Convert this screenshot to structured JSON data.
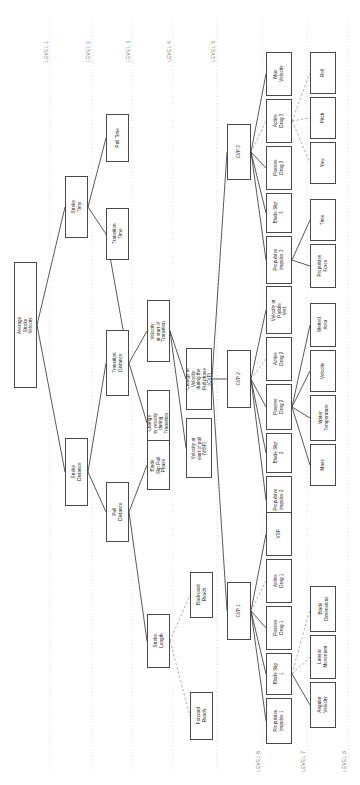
{
  "diagram": {
    "orientation": "rotated-90",
    "levels": [
      {
        "id": "l1",
        "label": "LEVEL 1",
        "x": 50
      },
      {
        "id": "l2",
        "label": "LEVEL 2",
        "x": 92
      },
      {
        "id": "l3",
        "label": "LEVEL 3",
        "x": 132
      },
      {
        "id": "l4",
        "label": "LEVEL 4",
        "x": 173
      },
      {
        "id": "l5",
        "label": "LEVEL 5",
        "x": 217
      },
      {
        "id": "l6",
        "label": "LEVEL 6",
        "x": 262
      },
      {
        "id": "l7",
        "label": "LEVEL 7",
        "x": 307
      },
      {
        "id": "l8",
        "label": "LEVEL 8",
        "x": 348
      }
    ],
    "colors": {
      "node_border": "#4a4a4a",
      "node_fill": "#ffffff",
      "edge_solid": "#3c3c3c",
      "edge_dashed": "#8c8c8c",
      "level_line": "#cfcfcf",
      "level_text": "#7a7a7a",
      "background": "#ffffff"
    },
    "nodes": [
      {
        "id": "avg_stroke_velocity",
        "label": "Average Stroke Velocity",
        "level": 1,
        "x": 14,
        "y": 262,
        "w": 23,
        "h": 126
      },
      {
        "id": "stroke_time",
        "label": "Stroke Time",
        "level": 2,
        "x": 65,
        "y": 176,
        "w": 23,
        "h": 62
      },
      {
        "id": "stroke_distance",
        "label": "Stroke Distance",
        "level": 2,
        "x": 65,
        "y": 438,
        "w": 23,
        "h": 68
      },
      {
        "id": "pull_time",
        "label": "Pull Time",
        "level": 3,
        "x": 106,
        "y": 114,
        "w": 23,
        "h": 48
      },
      {
        "id": "transition_time",
        "label": "Transition Time",
        "level": 3,
        "x": 106,
        "y": 208,
        "w": 23,
        "h": 52
      },
      {
        "id": "transition_distance",
        "label": "Transition Distance",
        "level": 3,
        "x": 106,
        "y": 330,
        "w": 23,
        "h": 66
      },
      {
        "id": "pull_distance",
        "label": "Pull Distance",
        "level": 3,
        "x": 106,
        "y": 482,
        "w": 23,
        "h": 60
      },
      {
        "id": "velocity_start_transition",
        "label": "Velocity at start of Transition",
        "level": 4,
        "x": 147,
        "y": 300,
        "w": 23,
        "h": 62
      },
      {
        "id": "change_velocity_transition",
        "label": "Change in velocity during Transition",
        "level": 4,
        "x": 147,
        "y": 390,
        "w": 23,
        "h": 66
      },
      {
        "id": "blade_slip_pull_phase",
        "label": "Blade Slip Pull Phase",
        "level": 4,
        "x": 147,
        "y": 440,
        "w": 23,
        "h": 50
      },
      {
        "id": "stroke_length",
        "label": "Stroke Length",
        "level": 4,
        "x": 147,
        "y": 614,
        "w": 23,
        "h": 54
      },
      {
        "id": "backward_reach",
        "label": "Backward Reach",
        "level": 5,
        "x": 190,
        "y": 572,
        "w": 23,
        "h": 46
      },
      {
        "id": "forward_reach",
        "label": "Forward Reach",
        "level": 5,
        "x": 190,
        "y": 692,
        "w": 23,
        "h": 48
      },
      {
        "id": "cvp",
        "label": "Change in Velocity during the Pull phase (CVP)",
        "level": 5,
        "x": 186,
        "y": 348,
        "w": 26,
        "h": 62
      },
      {
        "id": "vtsp",
        "label": "Velocity at start of pull (VtSP)",
        "level": 5,
        "x": 186,
        "y": 418,
        "w": 26,
        "h": 60
      },
      {
        "id": "cvp3",
        "label": "CVP 3",
        "level": 6,
        "x": 227,
        "y": 124,
        "w": 24,
        "h": 56
      },
      {
        "id": "cvp2",
        "label": "CVP 2",
        "level": 6,
        "x": 227,
        "y": 350,
        "w": 24,
        "h": 58
      },
      {
        "id": "cvp1",
        "label": "CVP 1",
        "level": 6,
        "x": 227,
        "y": 582,
        "w": 24,
        "h": 58
      },
      {
        "id": "max_velocity",
        "label": "Max. Velocity",
        "level": 7,
        "x": 266,
        "y": 52,
        "w": 26,
        "h": 44
      },
      {
        "id": "active_drag_3",
        "label": "Active Drag 3",
        "level": 7,
        "x": 266,
        "y": 99,
        "w": 26,
        "h": 44
      },
      {
        "id": "passive_drag_3",
        "label": "Passive Drag 3",
        "level": 7,
        "x": 266,
        "y": 146,
        "w": 26,
        "h": 44
      },
      {
        "id": "blade_slip_3",
        "label": "Blade Slip 3",
        "level": 7,
        "x": 266,
        "y": 193,
        "w": 26,
        "h": 40
      },
      {
        "id": "propulsive_impulse_3",
        "label": "Propulsive Impulse 3",
        "level": 7,
        "x": 266,
        "y": 236,
        "w": 26,
        "h": 48
      },
      {
        "id": "velocity_paddle_vert",
        "label": "Velocity at Paddle Vert.",
        "level": 7,
        "x": 266,
        "y": 286,
        "w": 26,
        "h": 48
      },
      {
        "id": "active_drag_2",
        "label": "Active Drag 2",
        "level": 7,
        "x": 266,
        "y": 337,
        "w": 26,
        "h": 44
      },
      {
        "id": "passive_drag_2",
        "label": "Passive Drag 2",
        "level": 7,
        "x": 266,
        "y": 384,
        "w": 26,
        "h": 46
      },
      {
        "id": "blade_slip_2",
        "label": "Blade Slip 2",
        "level": 7,
        "x": 266,
        "y": 433,
        "w": 26,
        "h": 40
      },
      {
        "id": "propulsive_impulse_2",
        "label": "Propulsive Impulse 2",
        "level": 7,
        "x": 266,
        "y": 476,
        "w": 26,
        "h": 48
      },
      {
        "id": "vsp",
        "label": "VSP",
        "level": 7,
        "x": 266,
        "y": 512,
        "w": 26,
        "h": 44
      },
      {
        "id": "active_drag_1",
        "label": "Active Drag 1",
        "level": 7,
        "x": 266,
        "y": 559,
        "w": 26,
        "h": 44
      },
      {
        "id": "passive_drag_1",
        "label": "Passive Drag 1",
        "level": 7,
        "x": 266,
        "y": 606,
        "w": 26,
        "h": 44
      },
      {
        "id": "blade_slip_1",
        "label": "Blade Slip 1",
        "level": 7,
        "x": 266,
        "y": 653,
        "w": 26,
        "h": 42
      },
      {
        "id": "propulsive_impulse_1",
        "label": "Propulsive Impulse 1",
        "level": 7,
        "x": 266,
        "y": 698,
        "w": 26,
        "h": 46
      },
      {
        "id": "roll",
        "label": "Roll",
        "level": 8,
        "x": 310,
        "y": 52,
        "w": 26,
        "h": 42
      },
      {
        "id": "pitch",
        "label": "Pitch",
        "level": 8,
        "x": 310,
        "y": 97,
        "w": 26,
        "h": 42
      },
      {
        "id": "yaw",
        "label": "Yaw",
        "level": 8,
        "x": 310,
        "y": 142,
        "w": 26,
        "h": 42
      },
      {
        "id": "time",
        "label": "Time",
        "level": 8,
        "x": 310,
        "y": 199,
        "w": 26,
        "h": 42
      },
      {
        "id": "propulsive_force",
        "label": "Propulsive Force",
        "level": 8,
        "x": 310,
        "y": 244,
        "w": 26,
        "h": 44
      },
      {
        "id": "wetted_area",
        "label": "Wetted Area",
        "level": 8,
        "x": 310,
        "y": 303,
        "w": 26,
        "h": 44
      },
      {
        "id": "velocity",
        "label": "Velocity",
        "level": 8,
        "x": 310,
        "y": 350,
        "w": 26,
        "h": 42
      },
      {
        "id": "water_temperature",
        "label": "Water Temperature",
        "level": 8,
        "x": 310,
        "y": 395,
        "w": 26,
        "h": 46
      },
      {
        "id": "mass",
        "label": "Mass",
        "level": 8,
        "x": 310,
        "y": 444,
        "w": 26,
        "h": 42
      },
      {
        "id": "blade_dimensions",
        "label": "Blade Dimensions",
        "level": 8,
        "x": 310,
        "y": 586,
        "w": 26,
        "h": 46
      },
      {
        "id": "lateral_movement",
        "label": "Lateral Movement",
        "level": 8,
        "x": 310,
        "y": 635,
        "w": 26,
        "h": 44
      },
      {
        "id": "angular_velocity",
        "label": "Angular Velocity",
        "level": 8,
        "x": 310,
        "y": 682,
        "w": 26,
        "h": 46
      }
    ],
    "edges": [
      {
        "from": "avg_stroke_velocity",
        "to": "stroke_time",
        "style": "solid"
      },
      {
        "from": "avg_stroke_velocity",
        "to": "stroke_distance",
        "style": "solid"
      },
      {
        "from": "stroke_time",
        "to": "pull_time",
        "style": "solid"
      },
      {
        "from": "stroke_time",
        "to": "transition_time",
        "style": "solid"
      },
      {
        "from": "stroke_distance",
        "to": "transition_distance",
        "style": "solid"
      },
      {
        "from": "stroke_distance",
        "to": "pull_distance",
        "style": "solid"
      },
      {
        "from": "transition_distance",
        "to": "transition_time",
        "style": "solid"
      },
      {
        "from": "transition_distance",
        "to": "velocity_start_transition",
        "style": "solid"
      },
      {
        "from": "transition_distance",
        "to": "change_velocity_transition",
        "style": "solid"
      },
      {
        "from": "pull_distance",
        "to": "blade_slip_pull_phase",
        "style": "solid"
      },
      {
        "from": "pull_distance",
        "to": "stroke_length",
        "style": "solid"
      },
      {
        "from": "stroke_length",
        "to": "backward_reach",
        "style": "dashed"
      },
      {
        "from": "stroke_length",
        "to": "forward_reach",
        "style": "dashed"
      },
      {
        "from": "velocity_start_transition",
        "to": "cvp",
        "style": "solid"
      },
      {
        "from": "velocity_start_transition",
        "to": "vtsp",
        "style": "solid"
      },
      {
        "from": "cvp",
        "to": "cvp2",
        "style": "solid"
      },
      {
        "from": "cvp",
        "to": "cvp3",
        "style": "solid"
      },
      {
        "from": "cvp",
        "to": "cvp1",
        "style": "solid"
      },
      {
        "from": "cvp3",
        "to": "max_velocity",
        "style": "solid"
      },
      {
        "from": "cvp3",
        "to": "active_drag_3",
        "style": "dashed"
      },
      {
        "from": "cvp3",
        "to": "passive_drag_3",
        "style": "solid"
      },
      {
        "from": "cvp3",
        "to": "blade_slip_3",
        "style": "solid"
      },
      {
        "from": "cvp3",
        "to": "propulsive_impulse_3",
        "style": "solid"
      },
      {
        "from": "active_drag_3",
        "to": "roll",
        "style": "dashed"
      },
      {
        "from": "active_drag_3",
        "to": "pitch",
        "style": "dashed"
      },
      {
        "from": "active_drag_3",
        "to": "yaw",
        "style": "dashed"
      },
      {
        "from": "propulsive_impulse_3",
        "to": "time",
        "style": "solid"
      },
      {
        "from": "propulsive_impulse_3",
        "to": "propulsive_force",
        "style": "solid"
      },
      {
        "from": "cvp2",
        "to": "velocity_paddle_vert",
        "style": "solid"
      },
      {
        "from": "cvp2",
        "to": "active_drag_2",
        "style": "dashed"
      },
      {
        "from": "cvp2",
        "to": "passive_drag_2",
        "style": "solid"
      },
      {
        "from": "cvp2",
        "to": "blade_slip_2",
        "style": "solid"
      },
      {
        "from": "cvp2",
        "to": "propulsive_impulse_2",
        "style": "solid"
      },
      {
        "from": "passive_drag_2",
        "to": "wetted_area",
        "style": "solid"
      },
      {
        "from": "passive_drag_2",
        "to": "velocity",
        "style": "solid"
      },
      {
        "from": "passive_drag_2",
        "to": "water_temperature",
        "style": "solid"
      },
      {
        "from": "passive_drag_2",
        "to": "mass",
        "style": "solid"
      },
      {
        "from": "cvp1",
        "to": "vsp",
        "style": "solid"
      },
      {
        "from": "cvp1",
        "to": "active_drag_1",
        "style": "dashed"
      },
      {
        "from": "cvp1",
        "to": "passive_drag_1",
        "style": "solid"
      },
      {
        "from": "cvp1",
        "to": "blade_slip_1",
        "style": "solid"
      },
      {
        "from": "cvp1",
        "to": "propulsive_impulse_1",
        "style": "solid"
      },
      {
        "from": "blade_slip_1",
        "to": "blade_dimensions",
        "style": "dashed"
      },
      {
        "from": "blade_slip_1",
        "to": "lateral_movement",
        "style": "dashed"
      },
      {
        "from": "blade_slip_1",
        "to": "angular_velocity",
        "style": "solid"
      }
    ],
    "level_label_positions": {
      "top_levels": [
        "LEVEL 1",
        "LEVEL 2",
        "LEVEL 3",
        "LEVEL 4",
        "LEVEL 5"
      ],
      "bottom_levels": [
        "LEVEL 6",
        "LEVEL 7",
        "LEVEL 8"
      ]
    }
  }
}
